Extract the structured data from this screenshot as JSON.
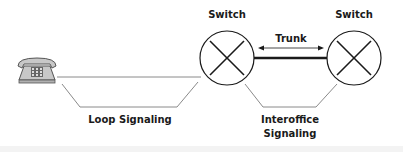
{
  "diagram": {
    "labels": {
      "switch_left": "Switch",
      "switch_right": "Switch",
      "trunk": "Trunk",
      "loop_signaling": "Loop Signaling",
      "interoffice_line1": "Interoffice",
      "interoffice_line2": "Signaling"
    },
    "nodes": [
      {
        "id": "telephone",
        "icon": "telephone-icon"
      },
      {
        "id": "switch-left",
        "icon": "switch-x-icon"
      },
      {
        "id": "switch-right",
        "icon": "switch-x-icon"
      }
    ],
    "edges": [
      {
        "from": "telephone",
        "to": "switch-left",
        "type": "line"
      },
      {
        "from": "switch-left",
        "to": "switch-right",
        "type": "trunk",
        "label": "Trunk"
      }
    ],
    "colors": {
      "stroke": "#1a1a1a",
      "thin_line": "#8a8a8a",
      "phone_fill": "#c8c8c8"
    }
  }
}
